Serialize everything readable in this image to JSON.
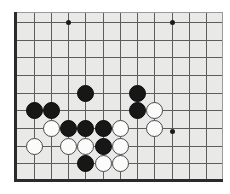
{
  "board": {
    "title": "Go board position",
    "game": "Go (Weiqi/Baduk)",
    "board_color": "#e9e9e7",
    "line_color": "#5d5d5d",
    "frame_color": "#2b2b2b",
    "black_stone_color": "#171717",
    "white_stone_color": "#fbfbfb",
    "view": {
      "note": "partial board view (upper-left quadrant region)",
      "columns": 12,
      "rows": 9,
      "cell_px": 17.3,
      "origin_x": 34,
      "origin_y": 22
    },
    "grid": {
      "vertical_x": [
        34,
        51,
        68,
        85,
        103,
        120,
        137,
        154,
        172,
        189,
        206
      ],
      "horizontal_y": [
        22,
        40,
        57,
        75,
        93,
        110,
        128,
        146,
        163
      ]
    },
    "star_points": [
      {
        "x": 68,
        "y": 22
      },
      {
        "x": 172,
        "y": 22
      },
      {
        "x": 172,
        "y": 131
      }
    ],
    "stones": [
      {
        "color": "black",
        "x": 85,
        "y": 93
      },
      {
        "color": "black",
        "x": 137,
        "y": 93
      },
      {
        "color": "black",
        "x": 34,
        "y": 110
      },
      {
        "color": "black",
        "x": 51,
        "y": 110
      },
      {
        "color": "black",
        "x": 137,
        "y": 110
      },
      {
        "color": "white",
        "x": 154,
        "y": 110
      },
      {
        "color": "white",
        "x": 51,
        "y": 128
      },
      {
        "color": "black",
        "x": 68,
        "y": 128
      },
      {
        "color": "black",
        "x": 85,
        "y": 128
      },
      {
        "color": "black",
        "x": 103,
        "y": 128
      },
      {
        "color": "white",
        "x": 120,
        "y": 128
      },
      {
        "color": "white",
        "x": 154,
        "y": 128
      },
      {
        "color": "white",
        "x": 34,
        "y": 146
      },
      {
        "color": "white",
        "x": 68,
        "y": 146
      },
      {
        "color": "white",
        "x": 85,
        "y": 146
      },
      {
        "color": "black",
        "x": 103,
        "y": 146
      },
      {
        "color": "white",
        "x": 120,
        "y": 146
      },
      {
        "color": "black",
        "x": 85,
        "y": 163
      },
      {
        "color": "white",
        "x": 103,
        "y": 163
      },
      {
        "color": "white",
        "x": 120,
        "y": 163
      }
    ],
    "counts": {
      "black_stones": 9,
      "white_stones": 11,
      "total_stones": 20
    }
  }
}
